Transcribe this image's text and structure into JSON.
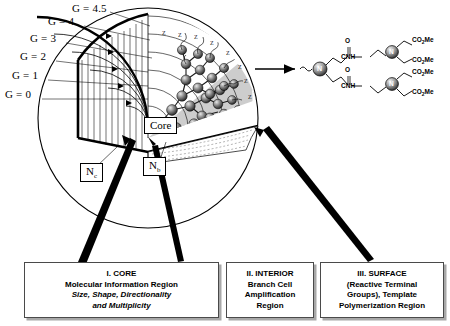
{
  "diagram": {
    "generations": [
      {
        "label": "G = 0",
        "x": 5,
        "y": 95
      },
      {
        "label": "G = 1",
        "x": 12,
        "y": 76
      },
      {
        "label": "G = 2",
        "x": 20,
        "y": 57
      },
      {
        "label": "G = 3",
        "x": 30,
        "y": 39
      },
      {
        "label": "G = 4",
        "x": 48,
        "y": 22
      },
      {
        "label": "G = 4.5",
        "x": 72,
        "y": 7
      }
    ],
    "core_label": "Core",
    "nc_label": "N",
    "nc_sub": "c",
    "nb_label": "N",
    "nb_sub": "b",
    "terminal_symbol": "Z"
  },
  "structure": {
    "nitrogen_symbol": "N",
    "amide_label": "CNH",
    "carbonyl_label": "O",
    "ester_label": "CO",
    "ester_sub": "2",
    "ester_suffix": "Me",
    "ester_count": 4
  },
  "captions": [
    {
      "name": "core",
      "lines": [
        {
          "text": "I. CORE",
          "italic": false
        },
        {
          "text": "Molecular Information Region",
          "italic": false
        },
        {
          "text": "Size, Shape, Directionality",
          "italic": true
        },
        {
          "text": "and Multiplicity",
          "italic": true
        }
      ]
    },
    {
      "name": "interior",
      "lines": [
        {
          "text": "II. INTERIOR",
          "italic": false
        },
        {
          "text": "Branch Cell",
          "italic": false
        },
        {
          "text": "Amplification",
          "italic": false
        },
        {
          "text": "Region",
          "italic": false
        }
      ]
    },
    {
      "name": "surface",
      "lines": [
        {
          "text": "III. SURFACE",
          "italic": false
        },
        {
          "text": "(Reactive Terminal",
          "italic": false
        },
        {
          "text": "Groups), Template",
          "italic": false
        },
        {
          "text": "Polymerization Region",
          "italic": false
        }
      ]
    }
  ],
  "colors": {
    "ink": "#000000",
    "box_border": "#4a4a4a",
    "box_shadow": "#a8a8a8",
    "shade": "#b9b9b9",
    "sphere_dark": "#2e2e2e",
    "sphere_light": "#d8d8d8"
  }
}
